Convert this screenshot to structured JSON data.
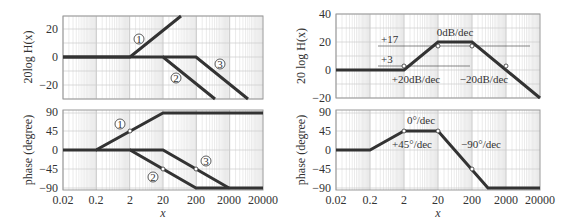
{
  "chart_data": [
    {
      "type": "line",
      "title": "",
      "panel": "left-magnitude",
      "xlabel": "",
      "ylabel": "20log H(x)",
      "xscale": "log",
      "xlim": [
        0.02,
        20000
      ],
      "ylim": [
        -30,
        30
      ],
      "yticks": [
        20,
        0,
        -20
      ],
      "grid": true,
      "series": [
        {
          "name": "1",
          "points": [
            [
              0.02,
              0
            ],
            [
              2,
              0
            ],
            [
              200,
              40
            ]
          ]
        },
        {
          "name": "2",
          "points": [
            [
              0.02,
              0
            ],
            [
              20,
              0
            ],
            [
              2000,
              -40
            ]
          ]
        },
        {
          "name": "3",
          "points": [
            [
              0.02,
              0
            ],
            [
              200,
              0
            ],
            [
              20000,
              -40
            ]
          ]
        }
      ],
      "annotations": [
        "1",
        "2",
        "3"
      ]
    },
    {
      "type": "line",
      "panel": "left-phase",
      "xlabel": "x",
      "ylabel": "phase (degree)",
      "xscale": "log",
      "xlim": [
        0.02,
        20000
      ],
      "ylim": [
        -90,
        90
      ],
      "xticks": [
        "0.02",
        "0.2",
        "2",
        "20",
        "200",
        "2000",
        "20000"
      ],
      "yticks": [
        90,
        45,
        0,
        -45,
        -90
      ],
      "grid": true,
      "series": [
        {
          "name": "1",
          "points": [
            [
              0.02,
              0
            ],
            [
              0.2,
              0
            ],
            [
              20,
              90
            ],
            [
              20000,
              90
            ]
          ],
          "markers": [
            [
              2,
              45
            ]
          ]
        },
        {
          "name": "2",
          "points": [
            [
              0.02,
              0
            ],
            [
              2,
              0
            ],
            [
              200,
              -90
            ],
            [
              20000,
              -90
            ]
          ],
          "markers": [
            [
              20,
              -45
            ]
          ]
        },
        {
          "name": "3",
          "points": [
            [
              0.02,
              0
            ],
            [
              20,
              0
            ],
            [
              2000,
              -90
            ],
            [
              20000,
              -90
            ]
          ],
          "markers": [
            [
              200,
              -45
            ]
          ]
        }
      ],
      "annotations": [
        "1",
        "2",
        "3"
      ]
    },
    {
      "type": "line",
      "panel": "right-magnitude",
      "xlabel": "",
      "ylabel": "20 log H(x)",
      "xscale": "log",
      "xlim": [
        0.02,
        20000
      ],
      "ylim": [
        -20,
        40
      ],
      "yticks": [
        40,
        20,
        0,
        -20
      ],
      "grid": true,
      "series": [
        {
          "name": "composite",
          "points": [
            [
              0.02,
              0
            ],
            [
              2,
              0
            ],
            [
              20,
              20
            ],
            [
              200,
              20
            ],
            [
              20000,
              -20
            ]
          ],
          "markers": [
            [
              2,
              3
            ],
            [
              20,
              17
            ],
            [
              200,
              17
            ],
            [
              2000,
              3
            ]
          ]
        }
      ],
      "annotations": [
        "+17",
        "+3",
        "0dB/dec",
        "+20dB/dec",
        "−20dB/dec"
      ]
    },
    {
      "type": "line",
      "panel": "right-phase",
      "xlabel": "x",
      "ylabel": "phase (degree)",
      "xscale": "log",
      "xlim": [
        0.02,
        20000
      ],
      "ylim": [
        -90,
        90
      ],
      "xticks": [
        "0.02",
        "0.2",
        "2",
        "20",
        "200",
        "2000",
        "20000"
      ],
      "yticks": [
        90,
        45,
        0,
        -45,
        -90
      ],
      "grid": true,
      "series": [
        {
          "name": "composite",
          "points": [
            [
              0.02,
              0
            ],
            [
              0.2,
              0
            ],
            [
              2,
              45
            ],
            [
              20,
              45
            ],
            [
              1000,
              -90
            ],
            [
              20000,
              -90
            ]
          ],
          "markers": [
            [
              2,
              45
            ],
            [
              20,
              45
            ],
            [
              200,
              -45
            ]
          ]
        }
      ],
      "annotations": [
        "0°/dec",
        "+45°/dec",
        "−90°/dec"
      ]
    }
  ],
  "labels": {
    "left_mag_ylabel": "20log H(x)",
    "left_phase_ylabel": "phase (degree)",
    "right_mag_ylabel": "20 log H(x)",
    "right_phase_ylabel": "phase (degree)",
    "xlabel": "x",
    "xticks": [
      "0.02",
      "0.2",
      "2",
      "20",
      "200",
      "2000",
      "20000"
    ],
    "left_mag_yticks": [
      "20",
      "0",
      "−20"
    ],
    "right_mag_yticks": [
      "40",
      "20",
      "0",
      "−20"
    ],
    "phase_yticks": [
      "90",
      "45",
      "0",
      "−45",
      "−90"
    ],
    "circ1": "1",
    "circ2": "2",
    "circ3": "3",
    "ann_p17": "+17",
    "ann_p3": "+3",
    "ann_0db": "0dB/dec",
    "ann_p20db": "+20dB/dec",
    "ann_m20db": "−20dB/dec",
    "ann_0deg": "0°/dec",
    "ann_p45deg": "+45°/dec",
    "ann_m90deg": "−90°/dec"
  }
}
